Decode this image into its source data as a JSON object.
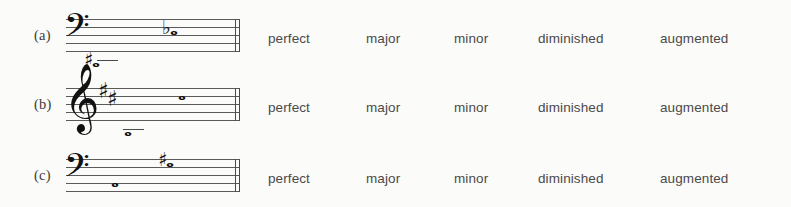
{
  "worksheet": {
    "answer_choices": [
      "perfect",
      "major",
      "minor",
      "diminished",
      "augmented"
    ],
    "rows": [
      {
        "label": "(a)",
        "clef": "bass-clef",
        "clef_glyph": "𝄢",
        "key_signature": [],
        "notes": [
          {
            "name": "lower-note",
            "accidental": "sharp",
            "accidental_glyph": "♯",
            "head_glyph": "𝅝",
            "ledger": true
          },
          {
            "name": "upper-note",
            "accidental": "flat",
            "accidental_glyph": "♭",
            "head_glyph": "𝅝",
            "ledger": false
          }
        ]
      },
      {
        "label": "(b)",
        "clef": "treble-clef",
        "clef_glyph": "𝄞",
        "key_signature": [
          "♯",
          "♯"
        ],
        "notes": [
          {
            "name": "lower-note",
            "accidental": "",
            "accidental_glyph": "",
            "head_glyph": "𝅝",
            "ledger": true
          },
          {
            "name": "upper-note",
            "accidental": "",
            "accidental_glyph": "",
            "head_glyph": "𝅝",
            "ledger": false
          }
        ]
      },
      {
        "label": "(c)",
        "clef": "bass-clef",
        "clef_glyph": "𝄢",
        "key_signature": [],
        "notes": [
          {
            "name": "lower-note",
            "accidental": "",
            "accidental_glyph": "",
            "head_glyph": "𝅝",
            "ledger": false
          },
          {
            "name": "upper-note",
            "accidental": "sharp",
            "accidental_glyph": "♯",
            "head_glyph": "𝅝",
            "ledger": false
          }
        ]
      }
    ]
  },
  "colors": {
    "background": "#fbfbf9",
    "staff_line": "#5a5a5a",
    "text": "#4a4a4a",
    "notation": "#111111"
  }
}
